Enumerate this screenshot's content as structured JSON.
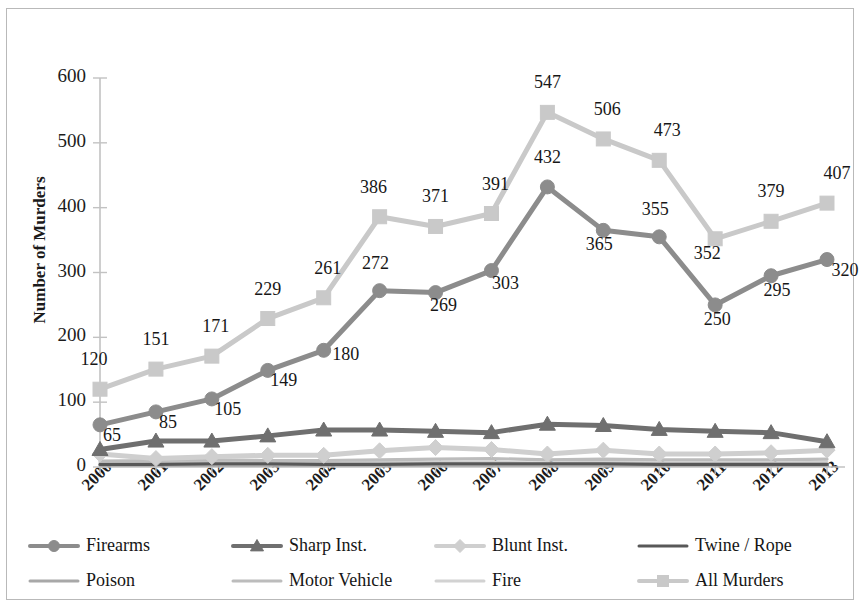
{
  "chart_data": {
    "type": "line",
    "title": "",
    "xlabel": "",
    "ylabel": "Number of Murders",
    "ylim": [
      0,
      600
    ],
    "yticks": [
      0,
      100,
      200,
      300,
      400,
      500,
      600
    ],
    "grid": false,
    "legend_position": "bottom",
    "categories": [
      "2000",
      "2001",
      "2002",
      "2003",
      "2004",
      "2005",
      "2006",
      "2007",
      "2008",
      "2009",
      "2010",
      "2011",
      "2012",
      "2013"
    ],
    "series": [
      {
        "name": "Firearms",
        "color": "#8c8c8c",
        "marker": "circle",
        "labeled": true,
        "values": [
          65,
          85,
          105,
          149,
          180,
          272,
          269,
          303,
          432,
          365,
          355,
          250,
          295,
          320
        ]
      },
      {
        "name": "Sharp Inst.",
        "color": "#6f6f6f",
        "marker": "triangle",
        "labeled": false,
        "values": [
          27,
          40,
          40,
          48,
          57,
          57,
          55,
          53,
          66,
          64,
          58,
          55,
          53,
          39
        ]
      },
      {
        "name": "Blunt Inst.",
        "color": "#cfcfcf",
        "marker": "diamond",
        "labeled": false,
        "values": [
          20,
          13,
          16,
          18,
          18,
          25,
          30,
          27,
          20,
          26,
          20,
          20,
          22,
          26
        ]
      },
      {
        "name": "Twine / Rope",
        "color": "#585858",
        "marker": "none",
        "labeled": false,
        "values": [
          4,
          4,
          5,
          5,
          4,
          4,
          5,
          5,
          5,
          5,
          4,
          4,
          4,
          4
        ]
      },
      {
        "name": "Poison",
        "color": "#a8a8a8",
        "marker": "none",
        "labeled": false,
        "values": [
          3,
          3,
          3,
          3,
          3,
          3,
          3,
          3,
          3,
          3,
          3,
          3,
          3,
          3
        ]
      },
      {
        "name": "Motor Vehicle",
        "color": "#bcbcbc",
        "marker": "none",
        "labeled": false,
        "values": [
          9,
          10,
          11,
          10,
          10,
          11,
          12,
          13,
          11,
          12,
          11,
          11,
          11,
          12
        ]
      },
      {
        "name": "Fire",
        "color": "#d2d2d2",
        "marker": "none",
        "labeled": false,
        "values": [
          6,
          6,
          7,
          6,
          6,
          7,
          7,
          7,
          6,
          7,
          6,
          6,
          6,
          7
        ]
      },
      {
        "name": "All Murders",
        "color": "#c9c9c9",
        "marker": "square",
        "labeled": true,
        "values": [
          120,
          151,
          171,
          229,
          261,
          386,
          371,
          391,
          547,
          506,
          473,
          352,
          379,
          407
        ]
      }
    ]
  },
  "axis": {
    "y_title": "Number of Murders",
    "y_ticks": [
      "0",
      "100",
      "200",
      "300",
      "400",
      "500",
      "600"
    ],
    "x_ticks": [
      "2000",
      "2001",
      "2002",
      "2003",
      "2004",
      "2005",
      "2006",
      "2007",
      "2008",
      "2009",
      "2010",
      "2011",
      "2012",
      "2013"
    ]
  },
  "legend": {
    "row1": [
      {
        "label": "Firearms",
        "marker": "circle",
        "color": "#8c8c8c"
      },
      {
        "label": "Sharp Inst.",
        "marker": "triangle",
        "color": "#6f6f6f"
      },
      {
        "label": "Blunt Inst.",
        "marker": "diamond",
        "color": "#cfcfcf"
      },
      {
        "label": "Twine / Rope",
        "marker": "none",
        "color": "#585858"
      }
    ],
    "row2": [
      {
        "label": "Poison",
        "marker": "none",
        "color": "#a8a8a8"
      },
      {
        "label": "Motor Vehicle",
        "marker": "none",
        "color": "#bcbcbc"
      },
      {
        "label": "Fire",
        "marker": "none",
        "color": "#d2d2d2"
      },
      {
        "label": "All Murders",
        "marker": "square",
        "color": "#c9c9c9"
      }
    ]
  },
  "data_labels": {
    "firearms": [
      "65",
      "85",
      "105",
      "149",
      "180",
      "272",
      "269",
      "303",
      "432",
      "365",
      "355",
      "250",
      "295",
      "320"
    ],
    "all_murders": [
      "120",
      "151",
      "171",
      "229",
      "261",
      "386",
      "371",
      "391",
      "547",
      "506",
      "473",
      "352",
      "379",
      "407"
    ]
  }
}
